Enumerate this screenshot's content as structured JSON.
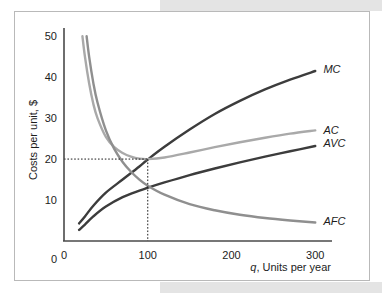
{
  "figure": {
    "background_color": "#ffffff",
    "border_color": "#b9b9b9",
    "page_band_color": "#e4e4e4"
  },
  "chart_data": {
    "type": "line",
    "title": "",
    "xlabel": "q, Units per year",
    "ylabel": "Costs per unit, $",
    "xlim": [
      0,
      320
    ],
    "ylim": [
      0,
      52
    ],
    "xticks": [
      "0",
      "100",
      "200",
      "300"
    ],
    "xtick_values": [
      0,
      100,
      200,
      300
    ],
    "yticks": [
      "0",
      "10",
      "20",
      "30",
      "40",
      "50"
    ],
    "ytick_values": [
      0,
      10,
      20,
      30,
      40,
      50
    ],
    "grid": false,
    "legend_position": "right-inline-labels",
    "annotations": [
      {
        "name": "ac-minimum-guides",
        "type": "dotted-crosshair",
        "x": 100,
        "y": 20,
        "description": "Dotted lines from axes to the point where MC crosses the minimum of AC at q = 100, cost = 20"
      }
    ],
    "series": [
      {
        "name": "MC",
        "label": "MC",
        "color": "#3c3c3c",
        "label_x": 305,
        "label_y": 42,
        "x": [
          18,
          25,
          35,
          50,
          70,
          90,
          100,
          120,
          150,
          180,
          210,
          240,
          270,
          300
        ],
        "values": [
          4.3,
          6.0,
          8.6,
          11.8,
          15.0,
          18.2,
          19.9,
          23.0,
          27.2,
          31.0,
          34.2,
          37.0,
          39.4,
          41.5
        ]
      },
      {
        "name": "AC",
        "label": "AC",
        "color": "#a9a9a9",
        "label_x": 305,
        "label_y": 27,
        "x": [
          22,
          25,
          30,
          35,
          40,
          50,
          60,
          70,
          80,
          90,
          100,
          120,
          150,
          180,
          210,
          240,
          270,
          300
        ],
        "values": [
          50.0,
          45.0,
          38.5,
          33.5,
          30.0,
          25.4,
          22.9,
          21.5,
          20.6,
          20.1,
          20.0,
          20.4,
          21.6,
          22.9,
          24.1,
          25.2,
          26.2,
          27.0
        ]
      },
      {
        "name": "AVC",
        "label": "AVC",
        "color": "#3c3c3c",
        "label_x": 305,
        "label_y": 24,
        "x": [
          18,
          25,
          35,
          50,
          70,
          90,
          100,
          120,
          150,
          180,
          210,
          240,
          270,
          300
        ],
        "values": [
          2.7,
          4.0,
          6.0,
          8.4,
          10.7,
          12.3,
          13.0,
          14.3,
          16.1,
          17.7,
          19.2,
          20.6,
          21.9,
          23.2
        ]
      },
      {
        "name": "AFC",
        "label": "AFC",
        "color": "#8f8f8f",
        "label_x": 305,
        "label_y": 5,
        "x": [
          27,
          30,
          35,
          40,
          50,
          60,
          70,
          80,
          90,
          100,
          120,
          150,
          180,
          210,
          240,
          270,
          300
        ],
        "values": [
          50.0,
          45.0,
          38.6,
          33.8,
          27.0,
          22.5,
          19.3,
          16.9,
          15.0,
          13.5,
          11.3,
          9.0,
          7.5,
          6.4,
          5.6,
          5.0,
          4.5
        ]
      }
    ]
  }
}
